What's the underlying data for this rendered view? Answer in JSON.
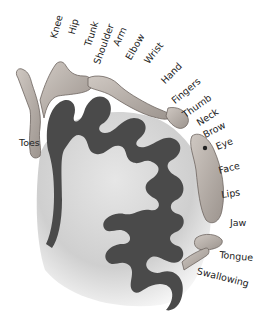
{
  "diagram": {
    "colors": {
      "gray_matter": "#4a4a4a",
      "white_matter": "#d2d2d2",
      "background": "#ffffff",
      "body_figure": "#b8b0aa",
      "label_text": "#222222"
    },
    "labels": [
      {
        "id": "knee",
        "text": "Knee"
      },
      {
        "id": "hip",
        "text": "Hip"
      },
      {
        "id": "trunk",
        "text": "Trunk"
      },
      {
        "id": "shoulder",
        "text": "Shoulder"
      },
      {
        "id": "arm",
        "text": "Arm"
      },
      {
        "id": "elbow",
        "text": "Elbow"
      },
      {
        "id": "wrist",
        "text": "Wrist"
      },
      {
        "id": "hand",
        "text": "Hand"
      },
      {
        "id": "fingers",
        "text": "Fingers"
      },
      {
        "id": "thumb",
        "text": "Thumb"
      },
      {
        "id": "neck",
        "text": "Neck"
      },
      {
        "id": "brow",
        "text": "Brow"
      },
      {
        "id": "eye",
        "text": "Eye"
      },
      {
        "id": "face",
        "text": "Face"
      },
      {
        "id": "lips",
        "text": "Lips"
      },
      {
        "id": "jaw",
        "text": "Jaw"
      },
      {
        "id": "tongue",
        "text": "Tongue"
      },
      {
        "id": "swallowing",
        "text": "Swallowing"
      },
      {
        "id": "toes",
        "text": "Toes"
      }
    ]
  }
}
